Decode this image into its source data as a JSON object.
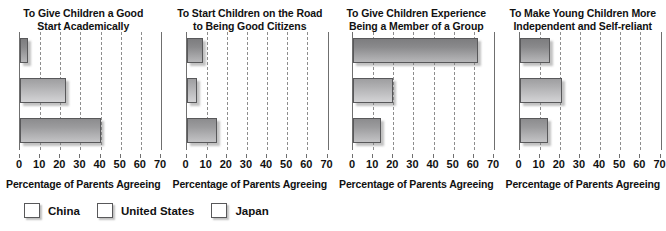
{
  "chart_data": {
    "type": "bar",
    "orientation": "horizontal",
    "title": "",
    "xlabel": "Percentage of Parents Agreeing",
    "ylabel": "",
    "xlim": [
      0,
      70
    ],
    "xticks": [
      0,
      10,
      20,
      30,
      40,
      50,
      60,
      70
    ],
    "grid": true,
    "legend_position": "bottom-left",
    "categories": [
      "China",
      "United States",
      "Japan"
    ],
    "series_colors": {
      "China": "#8a8a8c",
      "United States": "#b8b8ba",
      "Japan": "#9b9b9d"
    },
    "panels": [
      {
        "title": "To Give Children a Good Start Academically",
        "title_line1": "To Give Children a Good",
        "title_line2": "Start Academically",
        "xlabel": "Percentage of Parents Agreeing",
        "values": [
          4,
          23,
          40
        ],
        "bars": [
          {
            "name": "China",
            "value": 4
          },
          {
            "name": "United States",
            "value": 23
          },
          {
            "name": "Japan",
            "value": 40
          }
        ]
      },
      {
        "title": "To Start Children on the Road to Being Good Citizens",
        "title_line1": "To Start Children on the Road",
        "title_line2": "to Being Good Citizens",
        "xlabel": "Percentage of Parents Agreeing",
        "values": [
          8,
          5,
          15
        ],
        "bars": [
          {
            "name": "China",
            "value": 8
          },
          {
            "name": "United States",
            "value": 5
          },
          {
            "name": "Japan",
            "value": 15
          }
        ]
      },
      {
        "title": "To Give Children Experience Being a Member of a Group",
        "title_line1": "To Give Children Experience",
        "title_line2": "Being a Member of a Group",
        "xlabel": "Percentage of Parents Agreeing",
        "values": [
          62,
          20,
          14
        ],
        "bars": [
          {
            "name": "China",
            "value": 62
          },
          {
            "name": "United States",
            "value": 20
          },
          {
            "name": "Japan",
            "value": 14
          }
        ]
      },
      {
        "title": "To Make Young Children More Independent and Self-reliant",
        "title_line1": "To Make Young Children More",
        "title_line2": "Independent and Self-reliant",
        "xlabel": "Percentage of Parents Agreeing",
        "values": [
          15,
          21,
          14
        ],
        "bars": [
          {
            "name": "China",
            "value": 15
          },
          {
            "name": "United States",
            "value": 21
          },
          {
            "name": "Japan",
            "value": 14
          }
        ]
      }
    ],
    "legend": [
      {
        "label": "China",
        "color": "#8a8a8c"
      },
      {
        "label": "United States",
        "color": "#b8b8ba"
      },
      {
        "label": "Japan",
        "color": "#9b9b9d"
      }
    ]
  }
}
